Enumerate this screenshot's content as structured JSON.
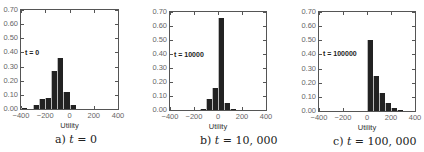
{
  "chart_data": [
    {
      "type": "bar",
      "subtype": "histogram",
      "title": "",
      "caption": "a) t = 0",
      "annotation": "t = 0",
      "xlabel": "Utility",
      "ylabel": "",
      "xlim": [
        -400,
        400
      ],
      "ylim": [
        0,
        0.7
      ],
      "xticks": [
        "-400",
        "-200",
        "0",
        "200",
        "400"
      ],
      "yticks": [
        "0.00",
        "0.10",
        "0.20",
        "0.30",
        "0.40",
        "0.50",
        "0.60",
        "0.70"
      ],
      "bin_width": 50,
      "bins": [
        {
          "x0": -400,
          "x1": -350,
          "value": 0.01
        },
        {
          "x0": -350,
          "x1": -300,
          "value": 0.0
        },
        {
          "x0": -300,
          "x1": -250,
          "value": 0.03
        },
        {
          "x0": -250,
          "x1": -200,
          "value": 0.07
        },
        {
          "x0": -200,
          "x1": -150,
          "value": 0.08
        },
        {
          "x0": -150,
          "x1": -100,
          "value": 0.27
        },
        {
          "x0": -100,
          "x1": -50,
          "value": 0.36
        },
        {
          "x0": -50,
          "x1": 0,
          "value": 0.12
        },
        {
          "x0": 0,
          "x1": 50,
          "value": 0.03
        }
      ],
      "grid": false,
      "legend": null
    },
    {
      "type": "bar",
      "subtype": "histogram",
      "title": "",
      "caption": "b) t = 10,000",
      "annotation": "t = 10000",
      "xlabel": "Utility",
      "ylabel": "",
      "xlim": [
        -400,
        400
      ],
      "ylim": [
        0,
        0.7
      ],
      "xticks": [
        "-400",
        "-200",
        "0",
        "200",
        "400"
      ],
      "yticks": [
        "0.00",
        "0.10",
        "0.20",
        "0.30",
        "0.40",
        "0.50",
        "0.60",
        "0.70"
      ],
      "bin_width": 50,
      "bins": [
        {
          "x0": -150,
          "x1": -100,
          "value": 0.01
        },
        {
          "x0": -100,
          "x1": -50,
          "value": 0.08
        },
        {
          "x0": -50,
          "x1": 0,
          "value": 0.16
        },
        {
          "x0": 0,
          "x1": 50,
          "value": 0.66
        },
        {
          "x0": 50,
          "x1": 100,
          "value": 0.05
        },
        {
          "x0": 100,
          "x1": 150,
          "value": 0.003
        }
      ],
      "grid": false,
      "legend": null
    },
    {
      "type": "bar",
      "subtype": "histogram",
      "title": "",
      "caption": "c) t = 100,000",
      "annotation": "t = 100000",
      "xlabel": "Utility",
      "ylabel": "",
      "xlim": [
        -400,
        400
      ],
      "ylim": [
        0,
        0.7
      ],
      "xticks": [
        "-400",
        "-200",
        "0",
        "200",
        "400"
      ],
      "yticks": [
        "0.00",
        "0.10",
        "0.20",
        "0.30",
        "0.40",
        "0.50",
        "0.60",
        "0.70"
      ],
      "bin_width": 50,
      "bins": [
        {
          "x0": 0,
          "x1": 50,
          "value": 0.5
        },
        {
          "x0": 50,
          "x1": 100,
          "value": 0.25
        },
        {
          "x0": 100,
          "x1": 150,
          "value": 0.13
        },
        {
          "x0": 150,
          "x1": 200,
          "value": 0.06
        },
        {
          "x0": 200,
          "x1": 250,
          "value": 0.02
        },
        {
          "x0": 250,
          "x1": 300,
          "value": 0.01
        }
      ],
      "grid": false,
      "legend": null
    }
  ],
  "panels": [
    {
      "id": "a",
      "caption_prefix": "a) ",
      "caption_var": "t",
      "caption_rest": " = 0",
      "annotation": "t = 0",
      "xlabel": "Utility"
    },
    {
      "id": "b",
      "caption_prefix": "b) ",
      "caption_var": "t",
      "caption_rest": " = 10, 000",
      "annotation": "t = 10000",
      "xlabel": "Utility"
    },
    {
      "id": "c",
      "caption_prefix": "c) ",
      "caption_var": "t",
      "caption_rest": " = 100, 000",
      "annotation": "t = 100000",
      "xlabel": "Utility"
    }
  ],
  "layout": {
    "plots": [
      {
        "left": 20,
        "top": 9,
        "width": 99,
        "height": 101,
        "annot_x": 5,
        "annot_y": 40,
        "caption_x": 55,
        "xlabel_y": 121,
        "caption_y": 133
      },
      {
        "left": 169,
        "top": 11,
        "width": 98,
        "height": 100,
        "annot_x": 5,
        "annot_y": 40,
        "caption_x": 200,
        "xlabel_y": 122,
        "caption_y": 134
      },
      {
        "left": 318,
        "top": 11,
        "width": 98,
        "height": 101,
        "annot_x": 5,
        "annot_y": 39,
        "caption_x": 333,
        "xlabel_y": 123,
        "caption_y": 135
      }
    ],
    "bar_color": "#222222",
    "axis_color": "#555555",
    "tick_label_color": "#666666"
  }
}
